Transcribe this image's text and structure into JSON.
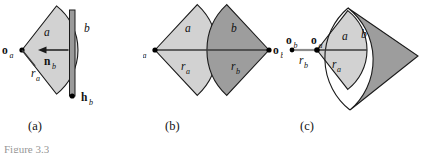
{
  "figure": {
    "number_text": "Figure 3.3",
    "panels": [
      {
        "id": "a",
        "caption": "(a)",
        "labels": {
          "origin_a": "o",
          "origin_a_sub": "a",
          "region_a": "a",
          "radius_a": "r",
          "radius_a_sub": "a",
          "segment_b": "b",
          "normal_b": "n",
          "normal_b_sub": "b",
          "head_b": "h",
          "head_b_sub": "b"
        }
      },
      {
        "id": "b",
        "caption": "(b)",
        "labels": {
          "origin_a": "o",
          "origin_a_sub": "a",
          "origin_b": "o",
          "origin_b_sub": "b",
          "region_a": "a",
          "region_b": "b",
          "radius_a": "r",
          "radius_a_sub": "a",
          "radius_b": "r",
          "radius_b_sub": "b"
        }
      },
      {
        "id": "c",
        "caption": "(c)",
        "labels": {
          "origin_a": "o",
          "origin_a_sub": "a",
          "origin_b": "o",
          "origin_b_sub": "b",
          "region_a": "a",
          "region_b": "b",
          "radius_a": "r",
          "radius_a_sub": "a",
          "radius_b": "r",
          "radius_b_sub": "b"
        }
      }
    ]
  },
  "colors": {
    "fill_light": "#d2d2d2",
    "fill_dark": "#9d9d9d",
    "stroke": "#1a1a1a",
    "bar": "#9a9a9a",
    "ray": "#8c8c8c",
    "background": "#ffffff"
  }
}
